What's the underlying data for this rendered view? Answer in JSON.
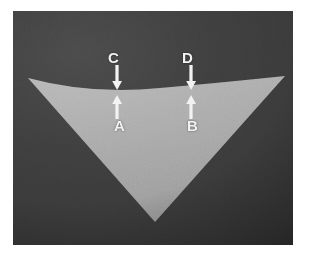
{
  "figure": {
    "kind": "photograph-diagram",
    "canvas": {
      "width": 310,
      "height": 255,
      "background_color": "#ffffff"
    },
    "backdrop": {
      "color": "#3a3a3a",
      "x": 13,
      "y": 11,
      "width": 280,
      "height": 234
    },
    "shape": {
      "name": "curved-edge-triangle",
      "fill_color": "#a8a8a8",
      "left_vertex": [
        28,
        78
      ],
      "right_vertex": [
        285,
        76
      ],
      "apex": [
        155,
        222
      ],
      "top_edge_curve": "concave-up, lowest near x=160 at y=88"
    },
    "labels": [
      {
        "id": "C",
        "text": "C",
        "x": 108,
        "y": 50,
        "arrow": "down",
        "target": "top-edge-left"
      },
      {
        "id": "D",
        "text": "D",
        "x": 182,
        "y": 50,
        "arrow": "down",
        "target": "top-edge-right"
      },
      {
        "id": "A",
        "text": "A",
        "x": 114,
        "y": 118,
        "arrow": "up",
        "target": "surface-left"
      },
      {
        "id": "B",
        "text": "B",
        "x": 187,
        "y": 118,
        "arrow": "up",
        "target": "surface-right"
      }
    ],
    "arrows": [
      {
        "id": "C",
        "direction": "down",
        "color": "#f2f2f2",
        "x": 117,
        "from_y": 65,
        "to_y": 88
      },
      {
        "id": "D",
        "direction": "down",
        "color": "#f2f2f2",
        "x": 191,
        "from_y": 65,
        "to_y": 88
      },
      {
        "id": "A",
        "direction": "up",
        "color": "#f2f2f2",
        "x": 117,
        "from_y": 116,
        "to_y": 94
      },
      {
        "id": "B",
        "direction": "up",
        "color": "#f2f2f2",
        "x": 191,
        "from_y": 116,
        "to_y": 94
      }
    ],
    "colors": {
      "background": "#ffffff",
      "backdrop": "#3a3a3a",
      "shape": "#a8a8a8",
      "annotation": "#f2f2f2"
    }
  }
}
